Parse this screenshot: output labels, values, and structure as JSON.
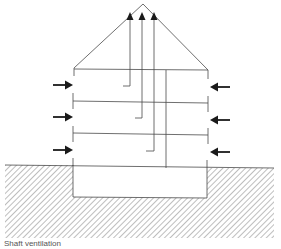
{
  "caption": "Shaft ventilation",
  "colors": {
    "line": "#4a4a4a",
    "arrow": "#1a1a1a",
    "hatch": "#9a9a9a",
    "background": "#ffffff"
  },
  "diagram": {
    "building": {
      "floors": 3,
      "has_basement": true,
      "roof": "pitched",
      "shafts": 3
    },
    "inflow_arrows": {
      "left": 3,
      "right": 3
    },
    "outflow_arrows": 3
  }
}
